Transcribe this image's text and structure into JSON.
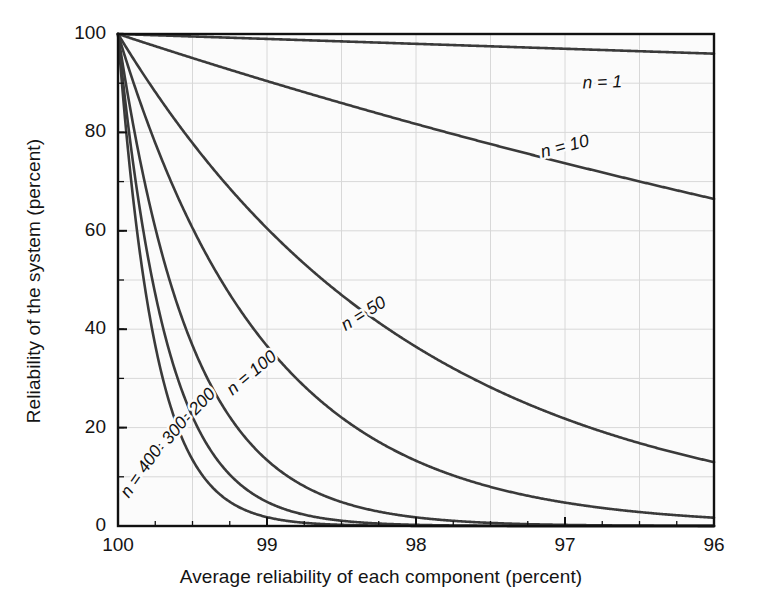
{
  "chart_data": {
    "type": "line",
    "title": "",
    "xlabel": "Average reliability of each component (percent)",
    "ylabel": "Reliability of the system (percent)",
    "xlim": [
      100,
      96
    ],
    "ylim": [
      0,
      100
    ],
    "x_ticks": [
      "100",
      "99",
      "98",
      "97",
      "96"
    ],
    "x_tick_values": [
      100,
      99,
      98,
      97,
      96
    ],
    "x_minor_interval": 0.25,
    "y_ticks": [
      "0",
      "20",
      "40",
      "60",
      "80",
      "100"
    ],
    "y_tick_values": [
      0,
      20,
      40,
      60,
      80,
      100
    ],
    "y_minor_interval": 10,
    "grid": true,
    "legend": "inline-curve-labels",
    "formula": "R = p^n",
    "series": [
      {
        "name": "n = 1",
        "n": 1,
        "label": "n = 1",
        "label_x": 96.75,
        "label_y": 90.0,
        "label_rotation": -2,
        "x": [
          100,
          99.5,
          99,
          98.5,
          98,
          97.5,
          97,
          96.5,
          96
        ],
        "values": [
          100,
          99.5,
          99,
          98.5,
          98,
          97.5,
          97,
          96.5,
          96
        ]
      },
      {
        "name": "n = 10",
        "n": 10,
        "label": "n = 10",
        "label_x": 97.0,
        "label_y": 77.0,
        "label_rotation": -14,
        "x": [
          100,
          99.5,
          99,
          98.5,
          98,
          97.5,
          97,
          96.5,
          96
        ],
        "values": [
          100,
          95.1,
          90.4,
          85.9,
          81.7,
          77.6,
          73.7,
          70.0,
          66.5
        ]
      },
      {
        "name": "n = 50",
        "n": 50,
        "label": "n = 50",
        "label_x": 98.35,
        "label_y": 43.0,
        "label_rotation": -32,
        "x": [
          100,
          99.75,
          99.5,
          99.25,
          99,
          98.5,
          98,
          97.5,
          97,
          96.5,
          96
        ],
        "values": [
          100,
          88.2,
          77.8,
          68.5,
          60.5,
          46.9,
          36.4,
          28.1,
          21.8,
          16.8,
          13.0
        ]
      },
      {
        "name": "n = 100",
        "n": 100,
        "label": "n = 100",
        "label_x": 99.1,
        "label_y": 31.0,
        "label_rotation": -40,
        "x": [
          100,
          99.75,
          99.5,
          99.25,
          99,
          98.5,
          98,
          97.5,
          97,
          96.5,
          96
        ],
        "values": [
          100,
          77.9,
          60.6,
          47.0,
          36.6,
          22.0,
          13.3,
          7.9,
          4.8,
          2.8,
          1.7
        ]
      },
      {
        "name": "n = 200",
        "n": 200,
        "label": "n = 200",
        "label_x": 99.5,
        "label_y": 23.0,
        "label_rotation": -46,
        "x": [
          100,
          99.75,
          99.5,
          99.25,
          99,
          98.5,
          98,
          97.5,
          97,
          96.5,
          96
        ],
        "values": [
          100,
          60.6,
          36.7,
          22.1,
          13.4,
          4.8,
          1.8,
          0.6,
          0.2,
          0.1,
          0.0
        ]
      },
      {
        "name": "n = 300",
        "n": 300,
        "label": "n = 300",
        "label_x": 99.68,
        "label_y": 17.0,
        "label_rotation": -50,
        "x": [
          100,
          99.75,
          99.5,
          99.25,
          99,
          98.5,
          98,
          97.5,
          97,
          96.5,
          96
        ],
        "values": [
          100,
          47.2,
          22.3,
          10.4,
          4.9,
          1.1,
          0.2,
          0.05,
          0.0,
          0.0,
          0.0
        ]
      },
      {
        "name": "n = 400",
        "n": 400,
        "label": "n = 400",
        "label_x": 99.84,
        "label_y": 11.0,
        "label_rotation": -55,
        "x": [
          100,
          99.75,
          99.5,
          99.25,
          99,
          98.5,
          98,
          97.5,
          97,
          96.5,
          96
        ],
        "values": [
          100,
          36.8,
          13.5,
          4.9,
          1.8,
          0.2,
          0.03,
          0.0,
          0.0,
          0.0,
          0.0
        ]
      }
    ]
  },
  "style": {
    "curve_color": "#3a3a3a",
    "axis_color": "#111111",
    "grid_color": "#d8d8d8",
    "background": "#fbfbfb",
    "page_background": "#ffffff"
  }
}
